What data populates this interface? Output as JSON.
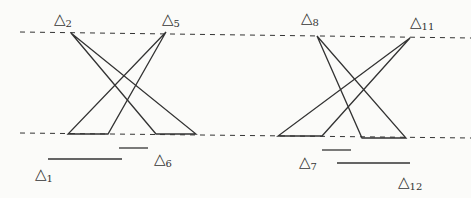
{
  "diagram": {
    "labels": [
      {
        "id": "d1",
        "sym": "△",
        "sub": "1",
        "x": 35,
        "y": 167
      },
      {
        "id": "d2",
        "sym": "△",
        "sub": "2",
        "x": 54,
        "y": 12
      },
      {
        "id": "d5",
        "sym": "△",
        "sub": "5",
        "x": 162,
        "y": 12
      },
      {
        "id": "d6",
        "sym": "△",
        "sub": "6",
        "x": 154,
        "y": 152
      },
      {
        "id": "d7",
        "sym": "△",
        "sub": "7",
        "x": 299,
        "y": 155
      },
      {
        "id": "d8",
        "sym": "△",
        "sub": "8",
        "x": 301,
        "y": 11
      },
      {
        "id": "d11",
        "sym": "△",
        "sub": "11",
        "x": 410,
        "y": 15
      },
      {
        "id": "d12",
        "sym": "△",
        "sub": "12",
        "x": 398,
        "y": 175
      }
    ],
    "dashed_lines": [
      {
        "x1": 20,
        "y1": 32,
        "x2": 471,
        "y2": 38
      },
      {
        "x1": 20,
        "y1": 133,
        "x2": 471,
        "y2": 138
      }
    ],
    "triangles": [
      {
        "apex": [
          71,
          33
        ],
        "base": [
          [
            156,
            134
          ],
          [
            196,
            134
          ]
        ]
      },
      {
        "apex": [
          166,
          32
        ],
        "base": [
          [
            68,
            134
          ],
          [
            108,
            134
          ]
        ]
      },
      {
        "apex": [
          317,
          36
        ],
        "base": [
          [
            362,
            138
          ],
          [
            406,
            138
          ]
        ]
      },
      {
        "apex": [
          410,
          38
        ],
        "base": [
          [
            278,
            136
          ],
          [
            322,
            136
          ]
        ]
      }
    ],
    "segments": [
      {
        "x1": 48,
        "y1": 159,
        "x2": 122,
        "y2": 159
      },
      {
        "x1": 119,
        "y1": 148,
        "x2": 148,
        "y2": 148
      },
      {
        "x1": 322,
        "y1": 150,
        "x2": 351,
        "y2": 150
      },
      {
        "x1": 337,
        "y1": 163,
        "x2": 410,
        "y2": 163
      }
    ]
  }
}
